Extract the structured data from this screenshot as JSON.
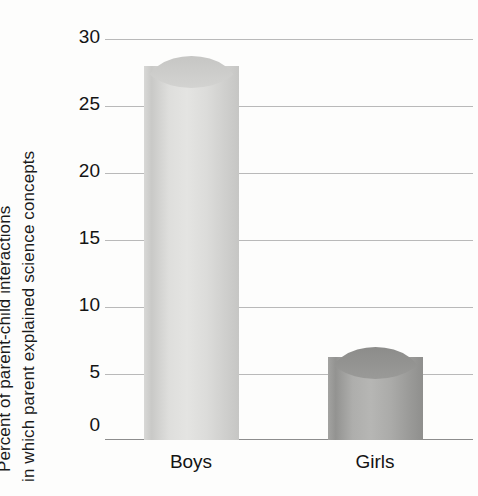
{
  "chart_data": {
    "type": "bar",
    "title": "",
    "subtitle": "",
    "categories": [
      "Boys",
      "Girls"
    ],
    "values": [
      28.8,
      7.0
    ],
    "series": [
      {
        "name": "Percent of parent-child interactions",
        "values": [
          28.8,
          7.0
        ]
      }
    ],
    "xlabel": "",
    "ylabel_line1": "Percent of parent-child interactions",
    "ylabel_line2": "in which parent explained science concepts",
    "ylim": [
      0,
      30
    ],
    "yticks": [
      "0",
      "5",
      "10",
      "15",
      "20",
      "25",
      "30"
    ],
    "ytick_values": [
      0,
      5,
      10,
      15,
      20,
      25,
      30
    ],
    "grid": true,
    "legend": "none",
    "bar_colors": [
      "#dcdcda",
      "#a8a8a6"
    ],
    "gridline_color": "#b9b9b9",
    "axis_color": "#8d8d8d",
    "background_color": "#fdfdfc",
    "text_color": "#141414"
  },
  "axis": {
    "y_title_line1": "Percent of parent-child interactions",
    "y_title_line2": "in which parent explained science concepts"
  },
  "ticks": {
    "y": [
      "30",
      "25",
      "20",
      "15",
      "10",
      "5",
      "0"
    ],
    "x": [
      "Boys",
      "Girls"
    ]
  }
}
